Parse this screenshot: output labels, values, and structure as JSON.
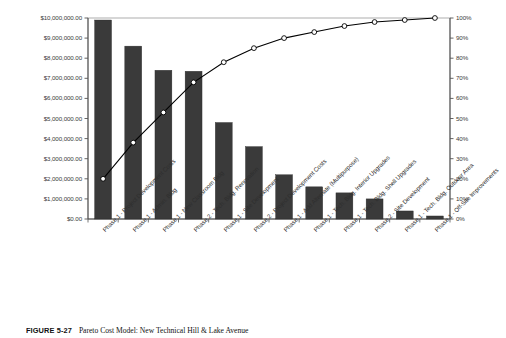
{
  "chart_data": {
    "type": "bar",
    "title": "",
    "subtitle": "",
    "xlabel": "",
    "ylabel": "",
    "y2label": "",
    "categories": [
      "Phase 1 - Project Development Costs",
      "Phase 1 - Admin. Bldg",
      "Phase 1 - New Classroom Bldg",
      "Phase 2 - Tech. Bldg. Renovation",
      "Phase 1 - Site Development",
      "Phase 2 - Project Development Costs",
      "Phase 1 - Add Alternate (Multipurpose)",
      "Phase 1 - Tech. Bldg. Interior Upgrades",
      "Phase 1 - Tech. Bldg. Shell Upgrades",
      "Phase 2 - Site Development",
      "Phase 1 - Tech. Bldg. Outdoor Area",
      "Phase 1 - Off-Site Improvements"
    ],
    "series": [
      {
        "name": "Cost",
        "type": "bar",
        "axis": "left",
        "values": [
          9900000,
          8600000,
          7400000,
          7350000,
          4800000,
          3600000,
          2200000,
          1600000,
          1300000,
          1000000,
          400000,
          150000
        ]
      },
      {
        "name": "Cumulative %",
        "type": "line",
        "axis": "right",
        "values": [
          20,
          38,
          53,
          68,
          78,
          85,
          90,
          93,
          96,
          98,
          99,
          100
        ]
      }
    ],
    "ylim": [
      0,
      10000000
    ],
    "y2lim": [
      0,
      100
    ],
    "ytick_labels": [
      "$0.00",
      "$1,000,000.00",
      "$2,000,000.00",
      "$3,000,000.00",
      "$4,000,000.00",
      "$5,000,000.00",
      "$6,000,000.00",
      "$7,000,000.00",
      "$8,000,000.00",
      "$9,000,000.00",
      "$10,000,000.00"
    ],
    "y2tick_labels": [
      "0%",
      "10%",
      "20%",
      "30%",
      "40%",
      "50%",
      "60%",
      "70%",
      "80%",
      "90%",
      "100%"
    ],
    "grid": false,
    "legend": "none",
    "colors": {
      "bar": "#3a3a3a",
      "line": "#000000",
      "marker_fill": "#ffffff",
      "axis": "#555555",
      "text": "#2e2e2e"
    }
  },
  "caption": {
    "figure_number": "FIGURE 5-27",
    "text": "Pareto Cost Model: New Technical Hill & Lake Avenue"
  }
}
